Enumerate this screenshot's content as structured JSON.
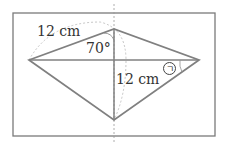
{
  "figure": {
    "labels": {
      "side_top_left": "12 cm",
      "angle_top": "70°",
      "segment_center": "12 cm",
      "angle_marker": "ㄱ"
    },
    "points": {
      "frame_top_left": [
        13,
        13
      ],
      "frame_bottom_right": [
        215,
        136
      ],
      "vertex_left": [
        29,
        60
      ],
      "vertex_top": [
        114,
        29
      ],
      "vertex_right": [
        199,
        60
      ],
      "vertex_bottom": [
        114,
        120
      ],
      "fold_line_x": 114
    },
    "colors": {
      "stroke": "#808080",
      "frame": "#7a7a7a",
      "dashed": "#b0b0b0",
      "text": "#333333"
    }
  }
}
